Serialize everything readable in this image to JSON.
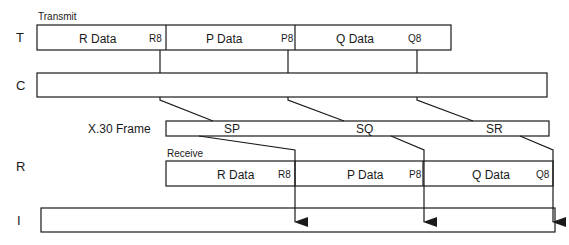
{
  "rows": {
    "t": "T",
    "c": "C",
    "r": "R",
    "i": "I"
  },
  "transmit": {
    "caption": "Transmit",
    "segments": [
      {
        "label": "R Data",
        "marker": "R8"
      },
      {
        "label": "P Data",
        "marker": "P8"
      },
      {
        "label": "Q Data",
        "marker": "Q8"
      }
    ]
  },
  "x30": {
    "caption": "X.30 Frame",
    "slots": [
      "SP",
      "SQ",
      "SR"
    ]
  },
  "receive": {
    "caption": "Receive",
    "segments": [
      {
        "label": "R Data",
        "marker": "R8"
      },
      {
        "label": "P Data",
        "marker": "P8"
      },
      {
        "label": "Q Data",
        "marker": "Q8"
      }
    ]
  },
  "colors": {
    "stroke": "#1a1a1a",
    "background": "#ffffff"
  }
}
